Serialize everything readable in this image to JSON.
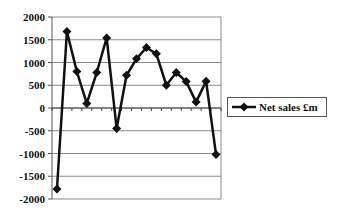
{
  "chart_data": {
    "type": "line",
    "title": "",
    "xlabel": "",
    "ylabel": "",
    "ylim": [
      -2000,
      2000
    ],
    "yticks": [
      2000,
      1500,
      1000,
      500,
      0,
      -500,
      -1000,
      -1500,
      -2000
    ],
    "grid": true,
    "legend_position": "right",
    "x": [
      1,
      2,
      3,
      4,
      5,
      6,
      7,
      8,
      9,
      10,
      11,
      12,
      13,
      14,
      15,
      16,
      17
    ],
    "series": [
      {
        "name": "Net sales £m",
        "marker": "diamond",
        "color": "#111111",
        "values": [
          -1780,
          1680,
          800,
          100,
          780,
          1540,
          -450,
          720,
          1080,
          1330,
          1190,
          500,
          780,
          580,
          130,
          590,
          -1020
        ]
      }
    ]
  },
  "legend": {
    "label": "Net sales £m"
  }
}
